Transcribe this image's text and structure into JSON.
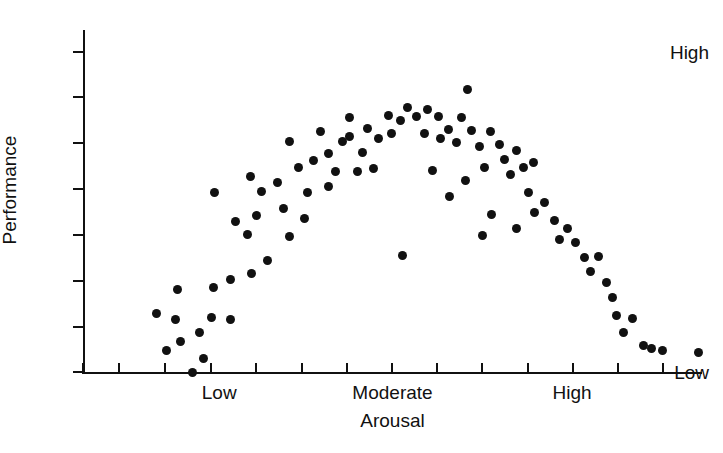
{
  "chart_data": {
    "type": "scatter",
    "title": "",
    "subtitle": "",
    "xlabel": "Arousal",
    "ylabel": "Performance",
    "grid": false,
    "legend": null,
    "annotations": [],
    "x_axis": {
      "tick_labels": [
        "Low",
        "Moderate",
        "High"
      ],
      "tick_label_values": [
        0.22,
        0.5,
        0.79
      ],
      "tick_count": 14,
      "tick_values": [
        0.0,
        0.058,
        0.132,
        0.207,
        0.279,
        0.354,
        0.427,
        0.499,
        0.572,
        0.645,
        0.719,
        0.792,
        0.865,
        0.937
      ],
      "xlim": [
        0,
        1
      ]
    },
    "y_axis": {
      "tick_labels": [
        "High",
        "Low"
      ],
      "tick_label_values": [
        1.0,
        0.0
      ],
      "tick_count": 8,
      "tick_values": [
        1.0,
        0.858,
        0.715,
        0.572,
        0.427,
        0.285,
        0.142,
        0.0
      ],
      "ylim": [
        -0.14,
        1.1
      ]
    },
    "marker": {
      "shape": "circle",
      "color": "#111111",
      "size": 9
    },
    "point_count": 88,
    "points": [
      {
        "x": 0.177,
        "y": 0.0
      },
      {
        "x": 0.135,
        "y": 0.068
      },
      {
        "x": 0.119,
        "y": 0.182
      },
      {
        "x": 0.149,
        "y": 0.163
      },
      {
        "x": 0.158,
        "y": 0.095
      },
      {
        "x": 0.194,
        "y": 0.041
      },
      {
        "x": 0.189,
        "y": 0.122
      },
      {
        "x": 0.207,
        "y": 0.17
      },
      {
        "x": 0.239,
        "y": 0.163
      },
      {
        "x": 0.211,
        "y": 0.265
      },
      {
        "x": 0.152,
        "y": 0.259
      },
      {
        "x": 0.239,
        "y": 0.289
      },
      {
        "x": 0.272,
        "y": 0.309
      },
      {
        "x": 0.298,
        "y": 0.349
      },
      {
        "x": 0.265,
        "y": 0.43
      },
      {
        "x": 0.212,
        "y": 0.562
      },
      {
        "x": 0.281,
        "y": 0.49
      },
      {
        "x": 0.246,
        "y": 0.47
      },
      {
        "x": 0.288,
        "y": 0.564
      },
      {
        "x": 0.271,
        "y": 0.612
      },
      {
        "x": 0.334,
        "y": 0.422
      },
      {
        "x": 0.324,
        "y": 0.51
      },
      {
        "x": 0.315,
        "y": 0.592
      },
      {
        "x": 0.348,
        "y": 0.64
      },
      {
        "x": 0.334,
        "y": 0.72
      },
      {
        "x": 0.372,
        "y": 0.662
      },
      {
        "x": 0.363,
        "y": 0.562
      },
      {
        "x": 0.358,
        "y": 0.48
      },
      {
        "x": 0.396,
        "y": 0.58
      },
      {
        "x": 0.397,
        "y": 0.682
      },
      {
        "x": 0.419,
        "y": 0.72
      },
      {
        "x": 0.431,
        "y": 0.796
      },
      {
        "x": 0.43,
        "y": 0.736
      },
      {
        "x": 0.452,
        "y": 0.686
      },
      {
        "x": 0.46,
        "y": 0.762
      },
      {
        "x": 0.477,
        "y": 0.73
      },
      {
        "x": 0.494,
        "y": 0.803
      },
      {
        "x": 0.499,
        "y": 0.745
      },
      {
        "x": 0.513,
        "y": 0.787
      },
      {
        "x": 0.524,
        "y": 0.828
      },
      {
        "x": 0.538,
        "y": 0.8
      },
      {
        "x": 0.551,
        "y": 0.746
      },
      {
        "x": 0.556,
        "y": 0.82
      },
      {
        "x": 0.575,
        "y": 0.798
      },
      {
        "x": 0.578,
        "y": 0.73
      },
      {
        "x": 0.59,
        "y": 0.758
      },
      {
        "x": 0.603,
        "y": 0.716
      },
      {
        "x": 0.612,
        "y": 0.794
      },
      {
        "x": 0.621,
        "y": 0.884
      },
      {
        "x": 0.627,
        "y": 0.754
      },
      {
        "x": 0.641,
        "y": 0.706
      },
      {
        "x": 0.648,
        "y": 0.64
      },
      {
        "x": 0.658,
        "y": 0.752
      },
      {
        "x": 0.673,
        "y": 0.71
      },
      {
        "x": 0.681,
        "y": 0.664
      },
      {
        "x": 0.69,
        "y": 0.616
      },
      {
        "x": 0.7,
        "y": 0.693
      },
      {
        "x": 0.712,
        "y": 0.638
      },
      {
        "x": 0.72,
        "y": 0.562
      },
      {
        "x": 0.73,
        "y": 0.498
      },
      {
        "x": 0.746,
        "y": 0.53
      },
      {
        "x": 0.762,
        "y": 0.474
      },
      {
        "x": 0.77,
        "y": 0.414
      },
      {
        "x": 0.783,
        "y": 0.45
      },
      {
        "x": 0.795,
        "y": 0.406
      },
      {
        "x": 0.81,
        "y": 0.358
      },
      {
        "x": 0.82,
        "y": 0.313
      },
      {
        "x": 0.833,
        "y": 0.36
      },
      {
        "x": 0.846,
        "y": 0.281
      },
      {
        "x": 0.856,
        "y": 0.232
      },
      {
        "x": 0.862,
        "y": 0.178
      },
      {
        "x": 0.873,
        "y": 0.124
      },
      {
        "x": 0.888,
        "y": 0.168
      },
      {
        "x": 0.905,
        "y": 0.082
      },
      {
        "x": 0.918,
        "y": 0.072
      },
      {
        "x": 0.936,
        "y": 0.068
      },
      {
        "x": 0.995,
        "y": 0.06
      },
      {
        "x": 0.728,
        "y": 0.654
      },
      {
        "x": 0.516,
        "y": 0.364
      },
      {
        "x": 0.7,
        "y": 0.448
      },
      {
        "x": 0.66,
        "y": 0.492
      },
      {
        "x": 0.645,
        "y": 0.427
      },
      {
        "x": 0.592,
        "y": 0.548
      },
      {
        "x": 0.618,
        "y": 0.6
      },
      {
        "x": 0.565,
        "y": 0.63
      },
      {
        "x": 0.443,
        "y": 0.627
      },
      {
        "x": 0.469,
        "y": 0.635
      },
      {
        "x": 0.408,
        "y": 0.628
      },
      {
        "x": 0.383,
        "y": 0.752
      }
    ]
  }
}
